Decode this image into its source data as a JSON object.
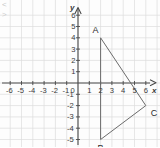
{
  "figure": {
    "corner_marks": "< >",
    "background_color": "#fdfdfd",
    "grid_color": "#dcdcdc",
    "axis_color": "#4a4a4a",
    "shape_color": "#6b6b6b",
    "text_color": "#3a3a3a"
  },
  "axes": {
    "x_axis_label": "x",
    "y_axis_label": "y",
    "origin_label": "0",
    "x_ticks": [
      "-6",
      "-5",
      "-4",
      "-3",
      "-2",
      "-1",
      "1",
      "2",
      "3",
      "4",
      "5",
      "6"
    ],
    "y_ticks": [
      "6",
      "5",
      "4",
      "3",
      "2",
      "1",
      "-1",
      "-2",
      "-3",
      "-4",
      "-5"
    ],
    "x_range": [
      -7,
      7
    ],
    "y_range": [
      -6,
      6.6
    ]
  },
  "chart_data": {
    "type": "scatter",
    "title": "",
    "xlabel": "x",
    "ylabel": "y",
    "xlim": [
      -7,
      7
    ],
    "ylim": [
      -6,
      6.6
    ],
    "grid": true,
    "x_ticks": [
      -6,
      -5,
      -4,
      -3,
      -2,
      -1,
      0,
      1,
      2,
      3,
      4,
      5,
      6
    ],
    "y_ticks": [
      -5,
      -4,
      -3,
      -2,
      -1,
      0,
      1,
      2,
      3,
      4,
      5,
      6
    ],
    "annotations": [
      {
        "label": "A",
        "x": 2,
        "y": 4
      },
      {
        "label": "B",
        "x": 2,
        "y": -5
      },
      {
        "label": "C",
        "x": 6,
        "y": -2
      }
    ],
    "series": [
      {
        "name": "triangle ABC",
        "type": "polygon",
        "closed": true,
        "points": [
          [
            2,
            4
          ],
          [
            6,
            -2
          ],
          [
            2,
            -5
          ]
        ]
      }
    ]
  },
  "vertices": [
    {
      "name": "A",
      "x": 2,
      "y": 4,
      "label_dx": -8,
      "label_dy": -12
    },
    {
      "name": "B",
      "x": 2,
      "y": -5,
      "label_dx": -3,
      "label_dy": 4
    },
    {
      "name": "C",
      "x": 6,
      "y": -2,
      "label_dx": 5,
      "label_dy": 3
    }
  ]
}
